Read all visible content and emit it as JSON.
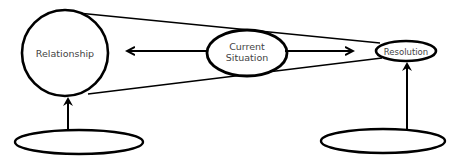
{
  "diagram": {
    "nodes": {
      "relationship": {
        "label": "Relationship",
        "shape": "circle"
      },
      "current_situation": {
        "label_line1": "Current",
        "label_line2": "Situation",
        "shape": "ellipse"
      },
      "resolution": {
        "label": "Resolution",
        "shape": "ellipse"
      },
      "bottom_left": {
        "label": "",
        "shape": "ellipse"
      },
      "bottom_right": {
        "label": "",
        "shape": "ellipse"
      }
    },
    "edges": [
      {
        "from": "current_situation",
        "to": "relationship",
        "type": "arrow"
      },
      {
        "from": "current_situation",
        "to": "resolution",
        "type": "arrow"
      },
      {
        "from": "bottom_left",
        "to": "relationship",
        "type": "arrow"
      },
      {
        "from": "bottom_right",
        "to": "resolution",
        "type": "arrow"
      },
      {
        "from": "relationship",
        "to": "resolution",
        "type": "tangent-cone-lines"
      }
    ],
    "colors": {
      "stroke": "#000000",
      "text": "#444444",
      "background": "#ffffff"
    }
  }
}
